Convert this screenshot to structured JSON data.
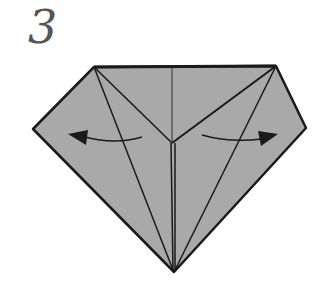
{
  "diagram": {
    "step_number": "3",
    "colors": {
      "paper_fill": "#a9a9a9",
      "line": "#1a1a1a",
      "background": "#ffffff",
      "number": "#555555"
    },
    "arrows": [
      {
        "direction": "left",
        "meaning": "fold-out-left"
      },
      {
        "direction": "right",
        "meaning": "fold-out-right"
      }
    ]
  }
}
